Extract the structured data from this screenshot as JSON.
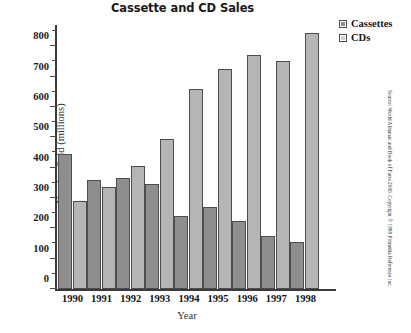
{
  "chart_data": {
    "type": "bar",
    "title": "Cassette and CD Sales",
    "xlabel": "Year",
    "ylabel": "Number Sold (millions)",
    "categories": [
      "1990",
      "1991",
      "1992",
      "1993",
      "1994",
      "1995",
      "1996",
      "1997",
      "1998"
    ],
    "series": [
      {
        "name": "Cassettes",
        "color": "#8e8e8e",
        "values": [
          445,
          360,
          365,
          345,
          240,
          270,
          225,
          175,
          155
        ]
      },
      {
        "name": "CDs",
        "color": "#b5b5b5",
        "values": [
          290,
          335,
          405,
          495,
          660,
          725,
          770,
          750,
          845
        ]
      }
    ],
    "ylim": [
      0,
      860
    ],
    "yticks": [
      0,
      100,
      200,
      300,
      400,
      500,
      600,
      700,
      800
    ],
    "ytick_minor_step": 50,
    "grid": false,
    "legend_position": "top-right"
  },
  "legend": {
    "items": [
      {
        "label": "Cassettes"
      },
      {
        "label": "CDs"
      }
    ]
  },
  "source_note": "Source: World Almanac and Book of Facts 2000. Copyright © 1999 Primedia Reference Inc."
}
